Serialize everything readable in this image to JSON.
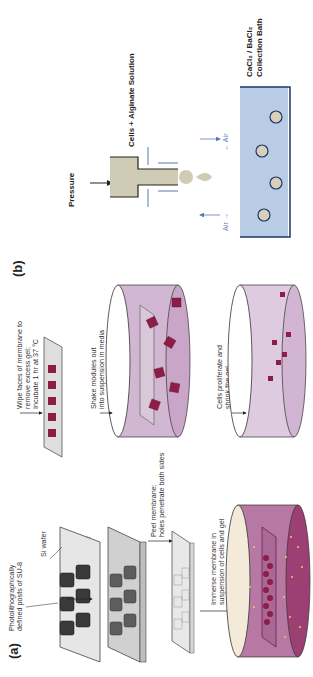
{
  "figure": {
    "orientation": "rotated 90 degrees counter-clockwise",
    "panel_a": {
      "label": "(a)",
      "steps": [
        {
          "id": "step1",
          "text_lines": [
            "Photolithographically",
            "defined posts of SU-8"
          ],
          "side_label": "Si wafer"
        },
        {
          "id": "step2",
          "text_lines": [
            "Spin PDMS;",
            "posts protrude",
            "through membrane"
          ]
        },
        {
          "id": "step3",
          "text_lines": [
            "Peel membrane;",
            "holes penetrate both sides"
          ]
        },
        {
          "id": "step4",
          "text_lines": [
            "Immerse membrane in",
            "suspension of cells and gel"
          ]
        },
        {
          "id": "step5",
          "text_lines": [
            "Wipe faces of membrane to",
            "remove excess gel;",
            "Incubate 1 hr at 37 °C"
          ]
        },
        {
          "id": "step6",
          "text_lines": [
            "Shake modules out",
            "into suspension in media"
          ]
        },
        {
          "id": "step7",
          "text_lines": [
            "Cells proliferate and",
            "shrink the gel"
          ]
        }
      ]
    },
    "panel_b": {
      "label": "(b)",
      "pressure_label": "Pressure",
      "solution_label": "Cells + Alginate Solution",
      "air_left": "Air →",
      "air_right": "← Air",
      "bath_label_lines": [
        "CaCl₂ / BaCl₂",
        "Collection Bath"
      ]
    },
    "colors": {
      "wafer": "#d9d9d9",
      "posts": "#3a3a3a",
      "membrane": "#cfcfcf",
      "dish_light": "#d7bfd6",
      "dish_dark": "#a8527f",
      "dish_rim": "#f1e6dc",
      "modules": "#8e1c48",
      "cells": "#f2c36b",
      "syringe_fill": "#cfcbb4",
      "bath": "#b9cce6",
      "bath_border": "#1f3668",
      "air_text": "#5d78b8",
      "bead_fill": "#d8d0b8"
    }
  }
}
